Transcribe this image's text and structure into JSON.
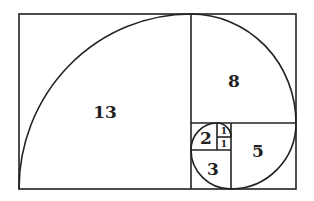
{
  "diagram": {
    "type": "fibonacci-spiral",
    "squares": [
      {
        "label": "13",
        "x": 19,
        "y": 14,
        "w": 172,
        "h": 175
      },
      {
        "label": "8",
        "x": 191,
        "y": 14,
        "w": 105,
        "h": 109
      },
      {
        "label": "5",
        "x": 231,
        "y": 123,
        "w": 65,
        "h": 66
      },
      {
        "label": "3",
        "x": 191,
        "y": 150,
        "w": 40,
        "h": 39
      },
      {
        "label": "2",
        "x": 191,
        "y": 123,
        "w": 26,
        "h": 27
      },
      {
        "label": "1",
        "x": 217,
        "y": 123,
        "w": 14,
        "h": 14
      },
      {
        "label": "1",
        "x": 217,
        "y": 137,
        "w": 14,
        "h": 13
      }
    ],
    "line_color": "#222222",
    "background": "#ffffff"
  }
}
